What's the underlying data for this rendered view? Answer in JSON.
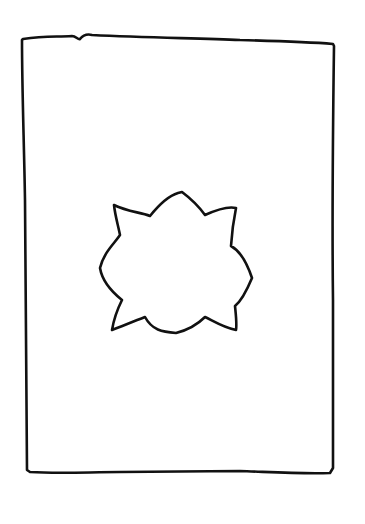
{
  "drawing": {
    "background": "#ffffff",
    "stroke_color": "#111111",
    "frame": {
      "shape": "hand-drawn rectangle"
    },
    "center_shape": {
      "shape": "hand-drawn eight-pointed star / flower outline"
    }
  }
}
